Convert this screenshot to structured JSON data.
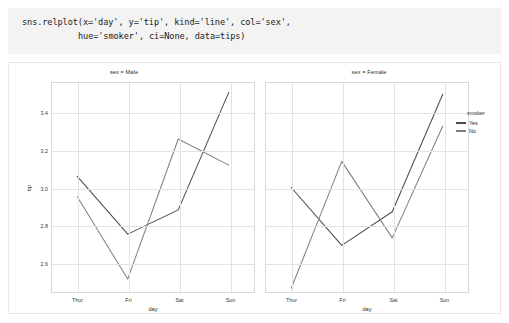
{
  "code_cell": {
    "line1": "sns.relplot(x='day', y='tip', kind='line', col='sex',",
    "line2": "hue='smoker', ci=None, data=tips)"
  },
  "legend": {
    "title": "smoker",
    "items": [
      {
        "label": "Yes",
        "color": "#4c4c4c"
      },
      {
        "label": "No",
        "color": "#808080"
      }
    ]
  },
  "panels": [
    {
      "title": "sex = Male",
      "xlabel": "day",
      "ylabel": "tip"
    },
    {
      "title": "sex = Female",
      "xlabel": "day",
      "ylabel": ""
    }
  ],
  "axis": {
    "yticks": [
      "3.4",
      "3.2",
      "3.0",
      "2.8",
      "2.6"
    ],
    "xticks": [
      "Thur",
      "Fri",
      "Sat",
      "Sun"
    ]
  },
  "chart_data": {
    "type": "line",
    "title": "",
    "xlabel": "day",
    "ylabel": "tip",
    "facet_col": "sex",
    "hue": "smoker",
    "x": [
      "Thur",
      "Fri",
      "Sat",
      "Sun"
    ],
    "ylim": [
      2.44,
      3.56
    ],
    "yticks": [
      3.4,
      3.2,
      3.0,
      2.8,
      2.6
    ],
    "grid": true,
    "legend_position": "right",
    "facets": [
      {
        "name": "sex = Male",
        "series": [
          {
            "name": "Yes",
            "color": "#4c4c4c",
            "values": [
              3.06,
              2.75,
              2.88,
              3.51
            ]
          },
          {
            "name": "No",
            "color": "#808080",
            "values": [
              2.95,
              2.51,
              3.26,
              3.12
            ]
          }
        ]
      },
      {
        "name": "sex = Female",
        "series": [
          {
            "name": "Yes",
            "color": "#4c4c4c",
            "values": [
              3.0,
              2.69,
              2.87,
              3.5
            ]
          },
          {
            "name": "No",
            "color": "#808080",
            "values": [
              2.46,
              3.14,
              2.73,
              3.33
            ]
          }
        ]
      }
    ]
  }
}
